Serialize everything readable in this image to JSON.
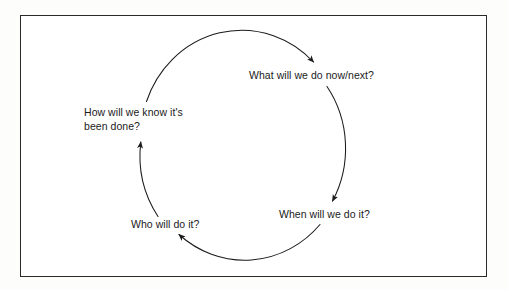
{
  "figure": {
    "type": "cycle-diagram",
    "background_color": "#ffffff",
    "frame_color": "#2a2a2a",
    "line_color": "#1b1b1b",
    "text_color": "#1b1b1b"
  },
  "diagram": {
    "direction": "clockwise",
    "nodes": [
      {
        "id": "what",
        "label": "What will we do now/next?",
        "position": "top-right",
        "order": 1
      },
      {
        "id": "when",
        "label": "When will we do it?",
        "position": "bottom-right",
        "order": 2
      },
      {
        "id": "who",
        "label": "Who will do it?",
        "position": "bottom-left",
        "order": 3
      },
      {
        "id": "how",
        "label": "How will we know it's\nbeen done?",
        "position": "left",
        "order": 4
      }
    ],
    "arrows": [
      {
        "id": "arrow-how-to-what",
        "from": "how",
        "to": "what",
        "arrowhead": "points-down-right"
      },
      {
        "id": "arrow-what-to-when",
        "from": "what",
        "to": "when",
        "arrowhead": "points-down-left"
      },
      {
        "id": "arrow-when-to-who",
        "from": "when",
        "to": "who",
        "arrowhead": "points-up-left"
      },
      {
        "id": "arrow-who-to-how",
        "from": "who",
        "to": "how",
        "arrowhead": "points-up"
      }
    ]
  }
}
